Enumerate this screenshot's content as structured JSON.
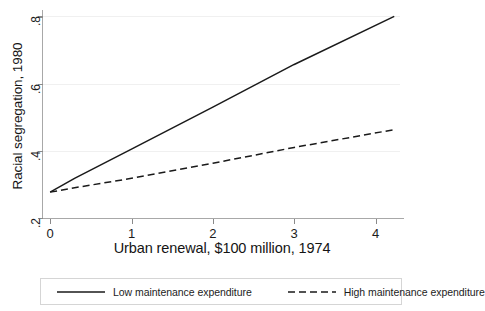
{
  "chart_data": {
    "type": "line",
    "title": "",
    "xlabel": "Urban renewal, $100 million, 1974",
    "ylabel": "Racial segregation, 1980",
    "xlim": [
      -0.1,
      4.35
    ],
    "ylim": [
      0.2,
      0.825
    ],
    "xticks": [
      "0",
      "1",
      "2",
      "3",
      "4"
    ],
    "xtick_values": [
      0,
      1,
      2,
      3,
      4
    ],
    "yticks": [
      ".2",
      ".4",
      ".6",
      ".8"
    ],
    "ytick_values": [
      0.2,
      0.4,
      0.6,
      0.8
    ],
    "grid": "horizontal-only",
    "legend_position": "below-plot",
    "series": [
      {
        "name": "Low maintenance expenditure",
        "style": "solid",
        "color": "#1a1a1a",
        "x": [
          0.0,
          0.3,
          1.0,
          2.0,
          3.0,
          4.23
        ],
        "values": [
          0.277,
          0.318,
          0.405,
          0.53,
          0.657,
          0.8
        ]
      },
      {
        "name": "High maintenance expenditure",
        "style": "dashed",
        "color": "#1a1a1a",
        "x": [
          0.0,
          0.3,
          1.0,
          2.0,
          3.0,
          4.23
        ],
        "values": [
          0.277,
          0.29,
          0.318,
          0.363,
          0.41,
          0.463
        ]
      }
    ]
  },
  "legend": {
    "entries": [
      {
        "label": "Low maintenance expenditure",
        "style": "solid"
      },
      {
        "label": "High maintenance expenditure",
        "style": "dashed"
      }
    ]
  },
  "colors": {
    "line": "#1a1a1a",
    "axis": "#a8a8a8",
    "grid": "#f0f0f0",
    "background": "#ffffff",
    "legend_border": "#d5d5d5"
  }
}
